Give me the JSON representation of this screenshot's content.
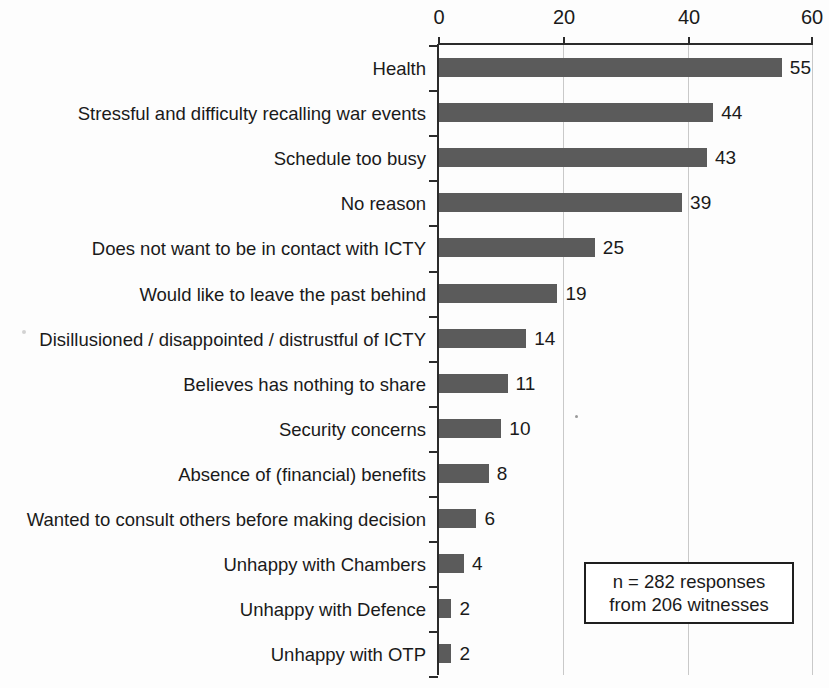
{
  "chart_data": {
    "type": "bar",
    "orientation": "horizontal",
    "title": "",
    "xlabel": "",
    "ylabel": "",
    "xlim": [
      0,
      60
    ],
    "xticks": [
      0,
      20,
      40,
      60
    ],
    "grid": true,
    "legend": false,
    "categories": [
      "Health",
      "Stressful and difficulty recalling war events",
      "Schedule too busy",
      "No reason",
      "Does not want to be in contact with ICTY",
      "Would like to leave the past behind",
      "Disillusioned / disappointed / distrustful of ICTY",
      "Believes has nothing to share",
      "Security concerns",
      "Absence of (financial) benefits",
      "Wanted to consult others before making decision",
      "Unhappy with Chambers",
      "Unhappy with Defence",
      "Unhappy with OTP"
    ],
    "values": [
      55,
      44,
      43,
      39,
      25,
      19,
      14,
      11,
      10,
      8,
      6,
      4,
      2,
      2
    ],
    "bar_color": "#5b5b5b",
    "annotation": {
      "line1": "n = 282 responses",
      "line2": "from 206 witnesses"
    }
  },
  "axis": {
    "tick_labels": [
      "0",
      "20",
      "40",
      "60"
    ]
  }
}
